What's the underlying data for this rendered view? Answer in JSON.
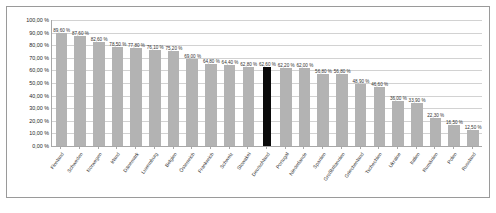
{
  "chart": {
    "type": "bar",
    "title": "",
    "axis_value_suffix": " %"
  },
  "chart_data": {
    "type": "bar",
    "title": "",
    "subtitle": "",
    "xlabel": "",
    "ylabel": "",
    "ylim": [
      0,
      100
    ],
    "ytick_labels": [
      "100,00 %",
      "90,00 %",
      "80,00 %",
      "70,00 %",
      "60,00 %",
      "50,00 %",
      "40,00 %",
      "30,00 %",
      "20,00 %",
      "10,00 %",
      "0,00 %"
    ],
    "ytick_values": [
      100,
      90,
      80,
      70,
      60,
      50,
      40,
      30,
      20,
      10,
      0
    ],
    "grid": true,
    "legend": false,
    "legend_position": "none",
    "highlight_category": "Deutschland",
    "colors": {
      "bar": "#b3b3b3",
      "bar_highlight": "#0a0a0a",
      "gridline": "#d2d2d2",
      "axis": "#a8a8a8",
      "border": "#9a9a9a",
      "text": "#333333",
      "background": "#ffffff"
    },
    "categories": [
      "Finnland",
      "Schweden",
      "Norwegen",
      "Irland",
      "Dänemark",
      "Luxemburg",
      "Belgien",
      "Österreich",
      "Frankreich",
      "Schweiz",
      "Slowakei",
      "Deutschland",
      "Portugal",
      "Niederlande",
      "Spanien",
      "Großbritannien",
      "Griechenland",
      "Tschechien",
      "Ukraine",
      "Italien",
      "Rumänien",
      "Polen",
      "Russland"
    ],
    "values": [
      89.6,
      87.6,
      82.6,
      78.5,
      77.8,
      76.1,
      75.2,
      69.0,
      64.8,
      64.4,
      62.8,
      62.6,
      62.2,
      62.0,
      56.8,
      56.8,
      48.9,
      46.6,
      36.0,
      33.9,
      22.3,
      16.5,
      12.5
    ],
    "data_labels": [
      "89,60 %",
      "87,60 %",
      "82,60 %",
      "78,50 %",
      "77,80 %",
      "76,10 %",
      "75,20 %",
      "69,00 %",
      "64,80 %",
      "64,40 %",
      "62,80 %",
      "62,60 %",
      "62,20 %",
      "62,00 %",
      "56,80 %",
      "56,80 %",
      "48,90 %",
      "46,60 %",
      "36,00 %",
      "33,90 %",
      "22,30 %",
      "16,50 %",
      "12,50 %"
    ]
  }
}
